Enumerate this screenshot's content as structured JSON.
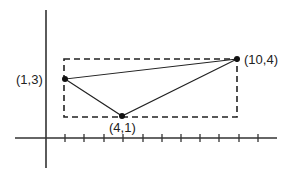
{
  "diagram": {
    "type": "coordinate-plane-triangle",
    "points": [
      {
        "label": "(1,3)",
        "x": 1,
        "y": 3
      },
      {
        "label": "(4,1)",
        "x": 4,
        "y": 1
      },
      {
        "label": "(10,4)",
        "x": 10,
        "y": 4
      }
    ],
    "bounding_rectangle": {
      "x_min": 1,
      "x_max": 10,
      "y_min": 1,
      "y_max": 4,
      "style": "dashed"
    },
    "x_axis_ticks": 11,
    "colors": {
      "stroke": "#222222",
      "background": "#ffffff"
    }
  }
}
